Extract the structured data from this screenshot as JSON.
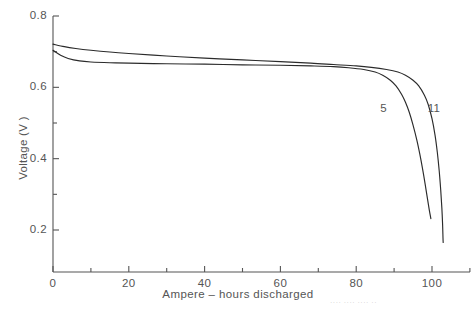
{
  "chart_data": {
    "type": "line",
    "title": "",
    "xlabel": "Ampere – hours discharged",
    "ylabel": "Voltage (V )",
    "xlim": [
      0,
      110
    ],
    "ylim": [
      0.082,
      0.8
    ],
    "grid": false,
    "legend_position": "inline-curve-labels",
    "x_ticks": [
      0,
      20,
      40,
      60,
      80,
      100
    ],
    "x_tick_labels": [
      "0",
      "20",
      "40",
      "60",
      "80",
      "100"
    ],
    "x_minor_ticks": [
      10,
      30,
      50,
      70,
      90,
      110
    ],
    "y_ticks": [
      0.2,
      0.4,
      0.6,
      0.8
    ],
    "y_tick_labels": [
      "0.2",
      "0.4",
      "0.6",
      "0.8"
    ],
    "y_minor_ticks": [
      0.3,
      0.5,
      0.7
    ],
    "series": [
      {
        "name": "5",
        "label": "5",
        "color": "#2b2b2b",
        "points": [
          [
            0,
            0.704
          ],
          [
            2,
            0.69
          ],
          [
            4,
            0.681
          ],
          [
            7,
            0.674
          ],
          [
            10,
            0.671
          ],
          [
            15,
            0.669
          ],
          [
            20,
            0.668
          ],
          [
            30,
            0.666
          ],
          [
            40,
            0.665
          ],
          [
            50,
            0.663
          ],
          [
            60,
            0.662
          ],
          [
            68,
            0.66
          ],
          [
            74,
            0.658
          ],
          [
            78,
            0.655
          ],
          [
            82,
            0.65
          ],
          [
            85,
            0.643
          ],
          [
            87,
            0.634
          ],
          [
            89,
            0.62
          ],
          [
            90.5,
            0.604
          ],
          [
            92,
            0.58
          ],
          [
            93,
            0.558
          ],
          [
            94,
            0.53
          ],
          [
            95,
            0.494
          ],
          [
            96,
            0.452
          ],
          [
            96.8,
            0.412
          ],
          [
            97.5,
            0.372
          ],
          [
            98.2,
            0.328
          ],
          [
            98.8,
            0.288
          ],
          [
            99.3,
            0.255
          ],
          [
            99.7,
            0.232
          ]
        ]
      },
      {
        "name": "11",
        "label": "11",
        "color": "#2b2b2b",
        "points": [
          [
            0,
            0.721
          ],
          [
            3,
            0.714
          ],
          [
            6,
            0.709
          ],
          [
            10,
            0.704
          ],
          [
            15,
            0.699
          ],
          [
            20,
            0.695
          ],
          [
            30,
            0.688
          ],
          [
            40,
            0.682
          ],
          [
            50,
            0.677
          ],
          [
            60,
            0.672
          ],
          [
            68,
            0.668
          ],
          [
            74,
            0.664
          ],
          [
            80,
            0.66
          ],
          [
            84,
            0.656
          ],
          [
            88,
            0.65
          ],
          [
            91,
            0.643
          ],
          [
            93,
            0.634
          ],
          [
            95,
            0.62
          ],
          [
            96.5,
            0.604
          ],
          [
            98,
            0.578
          ],
          [
            99,
            0.552
          ],
          [
            100,
            0.512
          ],
          [
            100.8,
            0.466
          ],
          [
            101.4,
            0.418
          ],
          [
            101.9,
            0.366
          ],
          [
            102.3,
            0.312
          ],
          [
            102.6,
            0.262
          ],
          [
            102.8,
            0.215
          ],
          [
            102.9,
            0.178
          ],
          [
            102.95,
            0.165
          ]
        ]
      }
    ],
    "curve_labels": [
      {
        "text": "5",
        "x": 89,
        "y": 0.54
      },
      {
        "text": "11",
        "x": 101.5,
        "y": 0.54
      }
    ]
  },
  "footer": {
    "cut_off_text": "···· ···· ···· ··"
  }
}
